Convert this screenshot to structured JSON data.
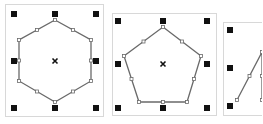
{
  "panels": [
    {
      "name": "hexagon-panel",
      "shape": "hexagon",
      "box": {
        "x": 5,
        "y": 4,
        "w": 99,
        "h": 113
      },
      "vertices": [
        [
          55,
          20
        ],
        [
          91,
          40
        ],
        [
          91,
          81
        ],
        [
          55,
          102
        ],
        [
          19,
          81
        ],
        [
          19,
          40
        ]
      ],
      "center": [
        55,
        61
      ],
      "handles": [
        [
          14,
          14
        ],
        [
          55,
          14
        ],
        [
          96,
          14
        ],
        [
          14,
          61
        ],
        [
          96,
          61
        ],
        [
          14,
          108
        ],
        [
          55,
          108
        ],
        [
          96,
          108
        ]
      ]
    },
    {
      "name": "pentagon-panel",
      "shape": "pentagon",
      "box": {
        "x": 112,
        "y": 13,
        "w": 105,
        "h": 103
      },
      "vertices": [
        [
          163,
          27
        ],
        [
          201,
          56
        ],
        [
          187,
          102
        ],
        [
          139,
          102
        ],
        [
          124,
          56
        ]
      ],
      "center": [
        163,
        64
      ],
      "handles": [
        [
          118,
          21
        ],
        [
          163,
          21
        ],
        [
          207,
          21
        ],
        [
          118,
          64
        ],
        [
          207,
          64
        ],
        [
          118,
          108
        ],
        [
          163,
          108
        ],
        [
          207,
          108
        ]
      ]
    },
    {
      "name": "triangle-panel",
      "shape": "triangle",
      "box": {
        "x": 223,
        "y": 22,
        "w": 45,
        "h": 94
      },
      "vertices": [
        [
          237,
          100
        ],
        [
          262,
          52
        ],
        [
          262,
          100
        ]
      ],
      "center": null,
      "handles": [
        [
          230,
          30
        ],
        [
          230,
          68
        ],
        [
          230,
          106
        ]
      ]
    }
  ],
  "colors": {
    "outline": "#6a6a6a",
    "handle": "#111111",
    "node_fill": "#ffffff",
    "node_stroke": "#6a6a6a",
    "border": "#d8d8d8"
  }
}
